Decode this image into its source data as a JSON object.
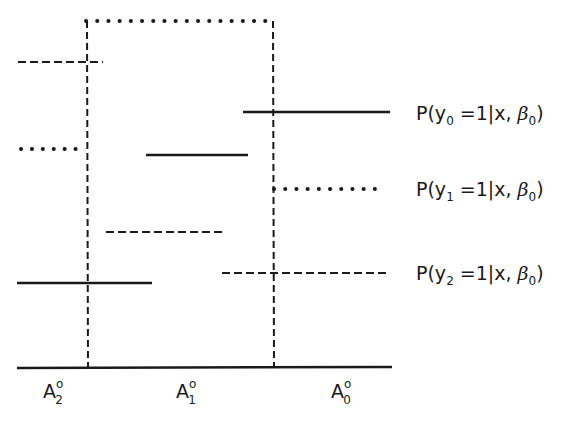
{
  "diagram": {
    "legend": [
      {
        "series": "y0",
        "style": "solid",
        "prefix": "P(y",
        "subscript": "0",
        "suffix": " =1|x, ",
        "beta": "β",
        "beta_sub": "0",
        "close": ")"
      },
      {
        "series": "y1",
        "style": "dotted",
        "prefix": "P(y",
        "subscript": "1",
        "suffix": " =1|x, ",
        "beta": "β",
        "beta_sub": "0",
        "close": ")"
      },
      {
        "series": "y2",
        "style": "dashed",
        "prefix": "P(y",
        "subscript": "2",
        "suffix": " =1|x, ",
        "beta": "β",
        "beta_sub": "0",
        "close": ")"
      }
    ],
    "regions": [
      {
        "label": "A",
        "superscript": "o",
        "subscript": "2"
      },
      {
        "label": "A",
        "superscript": "o",
        "subscript": "1"
      },
      {
        "label": "A",
        "superscript": "o",
        "subscript": "0"
      }
    ],
    "colors": {
      "ink": "#1a1a1a",
      "background": "#ffffff"
    }
  }
}
